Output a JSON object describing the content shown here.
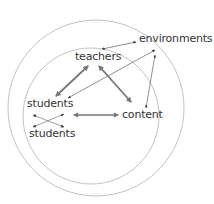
{
  "diagram": {
    "type": "concentric-circles relationship diagram",
    "colors": {
      "circle": "#bbbbbb",
      "arrow_thick": "#777777",
      "arrow_thin": "#444444",
      "text": "#333333"
    },
    "nodes": [
      {
        "id": "environments",
        "label": "environments"
      },
      {
        "id": "teachers",
        "label": "teachers"
      },
      {
        "id": "students1",
        "label": "students"
      },
      {
        "id": "content",
        "label": "content"
      },
      {
        "id": "students2",
        "label": "students"
      }
    ],
    "edges": [
      {
        "from": "teachers",
        "to": "environments",
        "style": "thin",
        "bidirectional": true
      },
      {
        "from": "students1",
        "to": "environments",
        "style": "thin",
        "bidirectional": true
      },
      {
        "from": "content",
        "to": "environments",
        "style": "thin",
        "bidirectional": true
      },
      {
        "from": "teachers",
        "to": "students1",
        "style": "thick",
        "bidirectional": true
      },
      {
        "from": "teachers",
        "to": "content",
        "style": "thick",
        "bidirectional": true
      },
      {
        "from": "students1",
        "to": "content",
        "style": "thick",
        "bidirectional": true
      },
      {
        "from": "students1",
        "to": "students2",
        "style": "thin-cross",
        "bidirectional": true
      }
    ],
    "circles": [
      {
        "name": "outer",
        "cx": 96,
        "cy": 108,
        "r": 88
      },
      {
        "name": "inner",
        "cx": 91,
        "cy": 116,
        "r": 68
      }
    ]
  }
}
